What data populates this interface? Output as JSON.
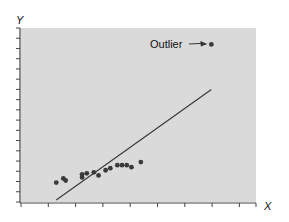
{
  "chart_data": {
    "type": "scatter",
    "title": "",
    "xlabel": "X",
    "ylabel": "Y",
    "xlim": [
      0,
      10
    ],
    "ylim": [
      0,
      17
    ],
    "grid": false,
    "legend": null,
    "x_ticks_count": 9,
    "y_ticks_count": 17,
    "series": [
      {
        "name": "points",
        "points": [
          {
            "x": 1.5,
            "y": 1.9
          },
          {
            "x": 1.8,
            "y": 2.3
          },
          {
            "x": 1.9,
            "y": 2.1
          },
          {
            "x": 2.6,
            "y": 2.4
          },
          {
            "x": 2.6,
            "y": 2.7
          },
          {
            "x": 2.8,
            "y": 2.8
          },
          {
            "x": 3.1,
            "y": 2.9
          },
          {
            "x": 3.3,
            "y": 2.6
          },
          {
            "x": 3.6,
            "y": 3.1
          },
          {
            "x": 3.8,
            "y": 3.3
          },
          {
            "x": 4.1,
            "y": 3.6
          },
          {
            "x": 4.3,
            "y": 3.6
          },
          {
            "x": 4.5,
            "y": 3.6
          },
          {
            "x": 4.7,
            "y": 3.4
          },
          {
            "x": 5.1,
            "y": 3.9
          },
          {
            "x": 8.1,
            "y": 15.4
          }
        ]
      },
      {
        "name": "regression-line",
        "type": "line",
        "points": [
          {
            "x": 1.5,
            "y": 0.2
          },
          {
            "x": 8.1,
            "y": 11.0
          }
        ]
      }
    ],
    "annotations": [
      {
        "text": "Outlier",
        "target": {
          "x": 8.1,
          "y": 15.4
        },
        "arrow": true
      }
    ]
  },
  "colors": {
    "plot_background": "#d9d9d9",
    "point": "#3a3a3a",
    "line": "#3a3a3a",
    "axis": "#444444"
  }
}
